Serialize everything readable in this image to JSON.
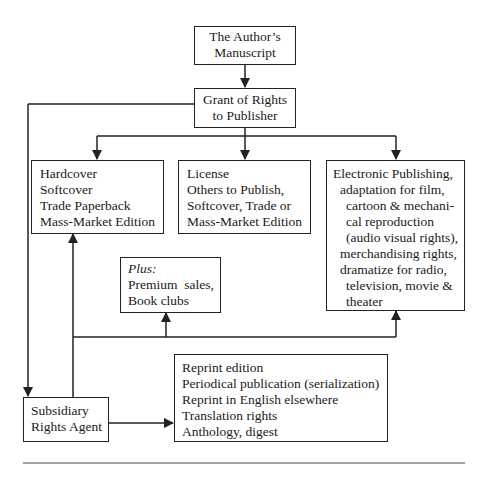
{
  "diagram": {
    "nodes": {
      "manuscript": {
        "lines": [
          "The Author’s",
          "Manuscript"
        ]
      },
      "grant": {
        "lines": [
          "Grant of Rights",
          "to Publisher"
        ]
      },
      "hardcover": {
        "lines": [
          "Hardcover",
          "Softcover",
          "Trade Paperback",
          "Mass-Market Edition"
        ]
      },
      "license": {
        "lines": [
          "License",
          "Others to Publish,",
          "Softcover, Trade or",
          "Mass-Market Edition"
        ]
      },
      "electronic": {
        "lines": [
          "Electronic Publishing,",
          "adaptation for film,",
          "cartoon & mechani-",
          "cal reproduction",
          "(audio visual rights),",
          "merchandising rights,",
          "dramatize for radio,",
          "television, movie &",
          "theater"
        ]
      },
      "plus": {
        "label": "Plus:",
        "lines": [
          "Premium  sales,",
          "Book clubs"
        ]
      },
      "agent": {
        "lines": [
          "Subsidiary",
          "Rights Agent"
        ]
      },
      "reprint": {
        "lines": [
          "Reprint edition",
          "Periodical publication (serialization)",
          "Reprint in English elsewhere",
          "Translation rights",
          "Anthology, digest"
        ]
      }
    },
    "edges": [
      {
        "from": "manuscript",
        "to": "grant"
      },
      {
        "from": "grant",
        "to": "hardcover"
      },
      {
        "from": "grant",
        "to": "license"
      },
      {
        "from": "grant",
        "to": "electronic"
      },
      {
        "from": "grant",
        "to": "agent"
      },
      {
        "from": "agent",
        "to": "hardcover"
      },
      {
        "from": "agent",
        "to": "plus"
      },
      {
        "from": "agent",
        "to": "electronic"
      },
      {
        "from": "agent",
        "to": "reprint"
      }
    ]
  }
}
